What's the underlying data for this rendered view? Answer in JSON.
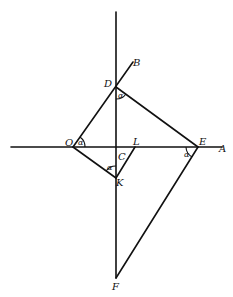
{
  "diagram": {
    "type": "geometric-construction",
    "stroke_color": "#111111",
    "background": "#ffffff",
    "points": {
      "O": "O",
      "D": "D",
      "B": "B",
      "L": "L",
      "C": "C",
      "E": "E",
      "A": "A",
      "K": "K",
      "F": "F"
    },
    "angle_label": "α",
    "angles": [
      {
        "vertex": "O",
        "label": "α"
      },
      {
        "vertex": "D",
        "label": "α"
      },
      {
        "vertex": "K",
        "label": "α"
      },
      {
        "vertex": "E",
        "label": "α"
      }
    ]
  }
}
